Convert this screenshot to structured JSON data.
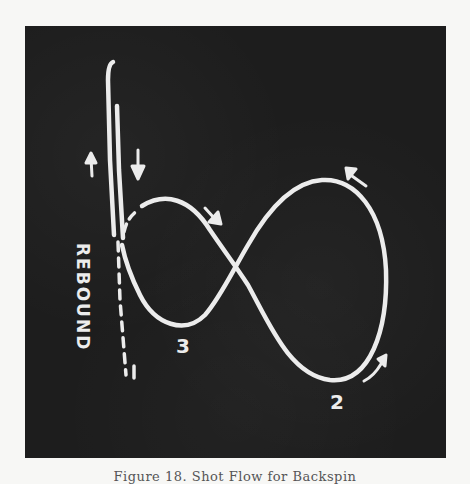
{
  "figure": {
    "labels": {
      "rebound": "REBOUND",
      "point_3": "3",
      "point_2": "2"
    },
    "arrows": [
      {
        "name": "up-arrow",
        "direction": "up"
      },
      {
        "name": "down-arrow",
        "direction": "down"
      },
      {
        "name": "down-right-arrow",
        "direction": "down-right"
      },
      {
        "name": "up-left-arrow",
        "direction": "up-left"
      },
      {
        "name": "up-right-arrow",
        "direction": "up-right"
      }
    ],
    "colors": {
      "background": "#1d1d1d",
      "stroke": "#ececec",
      "page": "#f7f7f5"
    }
  },
  "caption": "Figure 18. Shot Flow for Backspin"
}
